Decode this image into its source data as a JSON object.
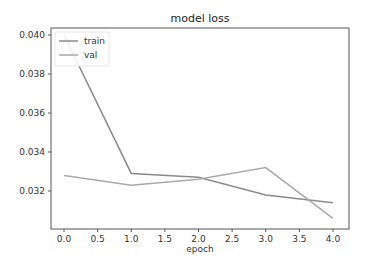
{
  "chart_data": {
    "type": "line",
    "title": "model loss",
    "xlabel": "epoch",
    "ylabel": "",
    "x": [
      0,
      1,
      2,
      3,
      4
    ],
    "series": [
      {
        "name": "train",
        "values": [
          0.04,
          0.0329,
          0.0327,
          0.0318,
          0.0314
        ],
        "color": "#8a8a8a"
      },
      {
        "name": "val",
        "values": [
          0.0328,
          0.0323,
          0.0326,
          0.0332,
          0.0306
        ],
        "color": "#a9a9a9"
      }
    ],
    "xticks": [
      "0.0",
      "0.5",
      "1.0",
      "1.5",
      "2.0",
      "2.5",
      "3.0",
      "3.5",
      "4.0"
    ],
    "yticks": [
      "0.032",
      "0.034",
      "0.036",
      "0.038",
      "0.040"
    ],
    "xlim": [
      -0.2,
      4.2
    ],
    "ylim": [
      0.0302,
      0.0403
    ],
    "grid": false,
    "legend_position": "upper left"
  }
}
